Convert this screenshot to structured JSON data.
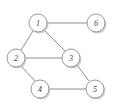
{
  "figure": {
    "kind": "undirected-graph-diagram",
    "background_color": "#ffffff",
    "node_fill_color": "#ffffff",
    "node_stroke_color": "#8d8d8d",
    "node_shadow_color": "#c9c7c5",
    "edge_color": "#8d8d8d",
    "label_color": "#3a3a3a",
    "node_radius": 9,
    "width": 116,
    "height": 107
  },
  "graph": {
    "nodes": [
      {
        "id": "1",
        "label": "1",
        "cx": 38,
        "cy": 23
      },
      {
        "id": "2",
        "label": "2",
        "cx": 16,
        "cy": 58
      },
      {
        "id": "3",
        "label": "3",
        "cx": 71,
        "cy": 58
      },
      {
        "id": "4",
        "label": "4",
        "cx": 40,
        "cy": 89
      },
      {
        "id": "5",
        "label": "5",
        "cx": 95,
        "cy": 89
      },
      {
        "id": "6",
        "label": "6",
        "cx": 96,
        "cy": 23
      }
    ],
    "edges": [
      {
        "id": "e1",
        "source": "1",
        "target": "6",
        "x1": 47,
        "y1": 23,
        "x2": 87,
        "y2": 23
      },
      {
        "id": "e2",
        "source": "1",
        "target": "2",
        "x1": 33,
        "y1": 31,
        "x2": 21,
        "y2": 50
      },
      {
        "id": "e3",
        "source": "1",
        "target": "3",
        "x1": 44,
        "y1": 30,
        "x2": 65,
        "y2": 51
      },
      {
        "id": "e4",
        "source": "2",
        "target": "3",
        "x1": 25,
        "y1": 58,
        "x2": 62,
        "y2": 58
      },
      {
        "id": "e5",
        "source": "2",
        "target": "4",
        "x1": 21,
        "y1": 66,
        "x2": 35,
        "y2": 81
      },
      {
        "id": "e6",
        "source": "3",
        "target": "5",
        "x1": 77,
        "y1": 65,
        "x2": 89,
        "y2": 81
      },
      {
        "id": "e7",
        "source": "4",
        "target": "5",
        "x1": 49,
        "y1": 89,
        "x2": 86,
        "y2": 89
      }
    ]
  }
}
